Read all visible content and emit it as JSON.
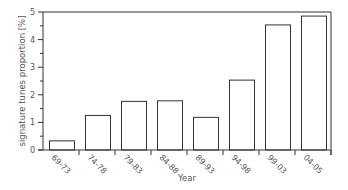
{
  "chart_data": {
    "type": "bar",
    "title": "",
    "xlabel": "Year",
    "ylabel": "signature tunes proportion [%]",
    "categories": [
      "69-73",
      "74-78",
      "79-83",
      "84-88",
      "89-93",
      "94-98",
      "99-03",
      "04-05"
    ],
    "values": [
      0.35,
      1.27,
      1.78,
      1.8,
      1.2,
      2.55,
      4.55,
      4.87
    ],
    "ylim": [
      0,
      5
    ],
    "yticks": [
      0,
      1,
      2,
      3,
      4,
      5
    ],
    "yminor_ticks": [
      0.5,
      1.5,
      2.5,
      3.5,
      4.5
    ],
    "grid": false,
    "legend": null,
    "xtick_rotation": 45,
    "colors": {
      "bar_fill": "#ffffff",
      "bar_stroke": "#333333",
      "axis": "#333333",
      "text": "#555555"
    }
  }
}
